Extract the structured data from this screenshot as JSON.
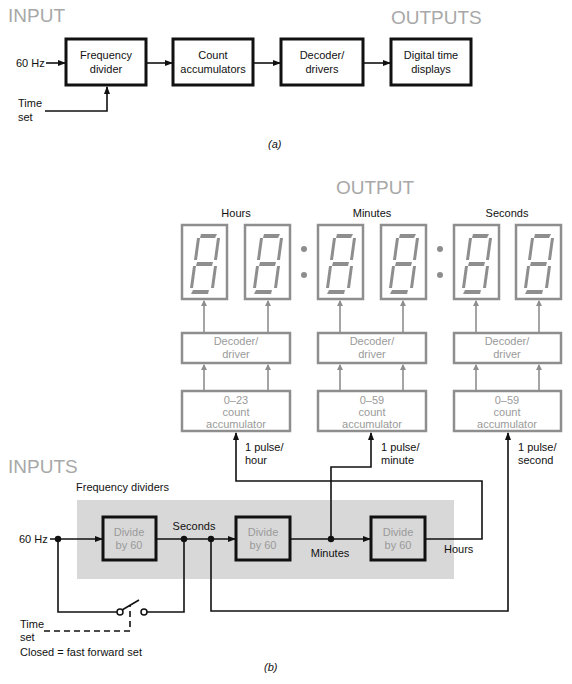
{
  "part_a": {
    "input_heading": "INPUT",
    "output_heading": "OUTPUTS",
    "input_signal": "60 Hz",
    "time_set_line1": "Time",
    "time_set_line2": "set",
    "blocks": [
      {
        "line1": "Frequency",
        "line2": "divider"
      },
      {
        "line1": "Count",
        "line2": "accumulators"
      },
      {
        "line1": "Decoder/",
        "line2": "drivers"
      },
      {
        "line1": "Digital time",
        "line2": "displays"
      }
    ],
    "caption": "(a)"
  },
  "part_b": {
    "output_heading": "OUTPUT",
    "display_groups": [
      {
        "label": "Hours",
        "decoder": {
          "line1": "Decoder/",
          "line2": "driver"
        },
        "accumulator": {
          "line1": "0–23",
          "line2": "count",
          "line3": "accumulator"
        },
        "pulse": {
          "line1": "1 pulse/",
          "line2": "hour"
        }
      },
      {
        "label": "Minutes",
        "decoder": {
          "line1": "Decoder/",
          "line2": "driver"
        },
        "accumulator": {
          "line1": "0–59",
          "line2": "count",
          "line3": "accumulator"
        },
        "pulse": {
          "line1": "1 pulse/",
          "line2": "minute"
        }
      },
      {
        "label": "Seconds",
        "decoder": {
          "line1": "Decoder/",
          "line2": "driver"
        },
        "accumulator": {
          "line1": "0–59",
          "line2": "count",
          "line3": "accumulator"
        },
        "pulse": {
          "line1": "1 pulse/",
          "line2": "second"
        }
      }
    ],
    "digit_count": 6,
    "inputs_heading": "INPUTS",
    "dividers_heading": "Frequency dividers",
    "input_signal": "60 Hz",
    "dividers": [
      {
        "line1": "Divide",
        "line2": "by 60"
      },
      {
        "line1": "Divide",
        "line2": "by 60"
      },
      {
        "line1": "Divide",
        "line2": "by 60"
      }
    ],
    "node_labels": {
      "seconds": "Seconds",
      "minutes": "Minutes",
      "hours": "Hours"
    },
    "time_set_line1": "Time",
    "time_set_line2": "set",
    "switch_note": "Closed = fast forward set",
    "caption": "(b)"
  },
  "colors": {
    "ink": "#111111",
    "gray_ink": "#8e8e8e",
    "heading_gray": "#a8a8a8",
    "band_gray": "#d8d8d8"
  }
}
